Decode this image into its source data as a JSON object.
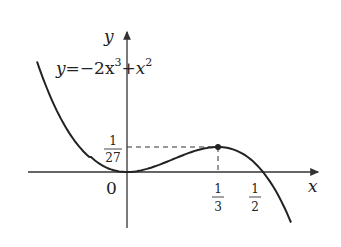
{
  "figure": {
    "equation": {
      "lhs": "y",
      "eq": "=",
      "term1": "−2x",
      "exp1": "3",
      "plus": "+",
      "term2": "x",
      "exp2": "2",
      "full": "y = -2x^3 + x^2"
    },
    "axes": {
      "x_label": "x",
      "y_label": "y",
      "origin_label": "0"
    },
    "ticks": {
      "x": [
        {
          "num": "1",
          "den": "3",
          "value": 0.3333
        },
        {
          "num": "1",
          "den": "2",
          "value": 0.5
        }
      ],
      "y": [
        {
          "num": "1",
          "den": "27",
          "value": 0.037
        }
      ]
    },
    "max_point": {
      "x": 0.3333,
      "y": 0.037,
      "label": "(1/3, 1/27)"
    },
    "colors": {
      "curve": "#222222",
      "axes": "#333333",
      "background": "#ffffff"
    }
  }
}
